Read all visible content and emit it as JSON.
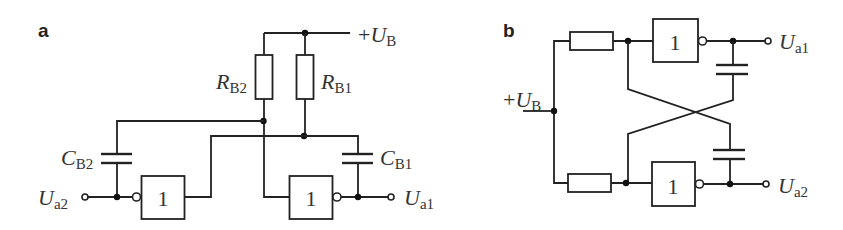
{
  "figure": {
    "panels": [
      {
        "label": "a",
        "supply": {
          "sign": "+",
          "symbol": "U",
          "sub": "B"
        },
        "resistors": [
          {
            "symbol": "R",
            "sub": "B2"
          },
          {
            "symbol": "R",
            "sub": "B1"
          }
        ],
        "capacitors": [
          {
            "symbol": "C",
            "sub": "B2"
          },
          {
            "symbol": "C",
            "sub": "B1"
          }
        ],
        "gates": [
          {
            "text": "1"
          },
          {
            "text": "1"
          }
        ],
        "outputs": [
          {
            "symbol": "U",
            "sub": "a2"
          },
          {
            "symbol": "U",
            "sub": "a1"
          }
        ]
      },
      {
        "label": "b",
        "supply": {
          "sign": "+",
          "symbol": "U",
          "sub": "B"
        },
        "gates": [
          {
            "text": "1"
          },
          {
            "text": "1"
          }
        ],
        "outputs": [
          {
            "symbol": "U",
            "sub": "a1"
          },
          {
            "symbol": "U",
            "sub": "a2"
          }
        ]
      }
    ]
  }
}
